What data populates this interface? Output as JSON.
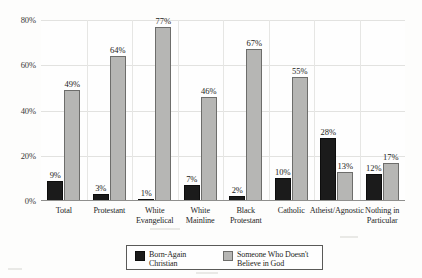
{
  "chart_data": {
    "type": "bar",
    "title": "",
    "xlabel": "",
    "ylabel": "",
    "ylim": [
      0,
      80
    ],
    "yticks": [
      0,
      20,
      40,
      60,
      80
    ],
    "ytick_labels": [
      "0%",
      "20%",
      "40%",
      "60%",
      "80%"
    ],
    "grid": true,
    "legend_position": "bottom",
    "categories": [
      "Total",
      "Protestant",
      "White Evangelical",
      "White Mainline",
      "Black Protestant",
      "Catholic",
      "Atheist/Agnostic",
      "Nothing in Particular"
    ],
    "category_lines": [
      [
        "Total"
      ],
      [
        "Protestant"
      ],
      [
        "White",
        "Evangelical"
      ],
      [
        "White",
        "Mainline"
      ],
      [
        "Black",
        "Protestant"
      ],
      [
        "Catholic"
      ],
      [
        "Atheist/Agnostic"
      ],
      [
        "Nothing in",
        "Particular"
      ]
    ],
    "series": [
      {
        "name": "Born-Again Christian",
        "color": "#1b1b1b",
        "values": [
          9,
          3,
          1,
          7,
          2,
          10,
          28,
          12
        ],
        "labels": [
          "9%",
          "3%",
          "1%",
          "7%",
          "2%",
          "10%",
          "28%",
          "12%"
        ]
      },
      {
        "name": "Someone Who Doesn't Believe in God",
        "color": "#b6b6b4",
        "values": [
          49,
          64,
          77,
          46,
          67,
          55,
          13,
          17
        ],
        "labels": [
          "49%",
          "64%",
          "77%",
          "46%",
          "67%",
          "55%",
          "13%",
          "17%"
        ]
      }
    ]
  },
  "legend": {
    "items": [
      {
        "label_lines": [
          "Born-Again",
          "Christian"
        ],
        "swatch": "dark"
      },
      {
        "label_lines": [
          "Someone Who Doesn't",
          "Believe in God"
        ],
        "swatch": "light"
      }
    ]
  },
  "colors": {
    "series_dark": "#1b1b1b",
    "series_light": "#b6b6b4",
    "background": "#fdfdfc",
    "gridline": "#e2e2e0",
    "axis": "#8f8f8d"
  }
}
